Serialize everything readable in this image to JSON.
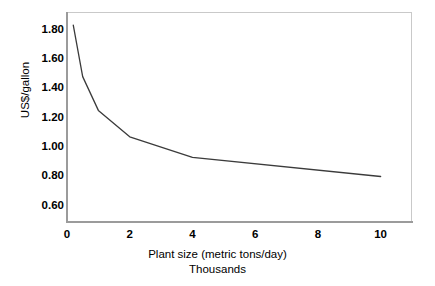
{
  "chart_data": {
    "type": "line",
    "title": "",
    "xlabel": "Plant size (metric tons/day)",
    "xlabel_sub": "Thousands",
    "ylabel": "US$/gallon",
    "xlim": [
      0,
      11
    ],
    "ylim": [
      0.49,
      1.92
    ],
    "grid": false,
    "legend": null,
    "xticks": [
      "0",
      "2",
      "4",
      "6",
      "8",
      "10"
    ],
    "xtick_values": [
      0,
      2,
      4,
      6,
      8,
      10
    ],
    "yticks": [
      "0.60",
      "0.80",
      "1.00",
      "1.20",
      "1.40",
      "1.60",
      "1.80"
    ],
    "ytick_values": [
      0.6,
      0.8,
      1.0,
      1.2,
      1.4,
      1.6,
      1.8
    ],
    "series": [
      {
        "name": "Cost per gallon",
        "color": "#3b3b3b",
        "x": [
          0.2,
          0.5,
          1.0,
          2.0,
          4.0,
          10.0
        ],
        "y": [
          1.83,
          1.48,
          1.25,
          1.07,
          0.93,
          0.8
        ]
      }
    ]
  },
  "axes": {
    "frame_color": "#c9c9c9",
    "axis_color": "#9b9b9b"
  }
}
